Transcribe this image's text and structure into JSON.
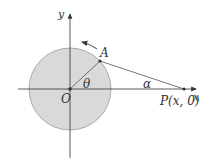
{
  "diagram": {
    "labels": {
      "y_axis": "y",
      "x_axis": "x",
      "origin": "O",
      "point_a": "A",
      "point_p": "P(x, 0)",
      "angle_theta": "θ",
      "angle_alpha": "α"
    },
    "colors": {
      "circle_fill": "#d9d9d9",
      "circle_stroke": "#9a9a9a",
      "axis": "#333333",
      "segment": "#555555"
    }
  }
}
